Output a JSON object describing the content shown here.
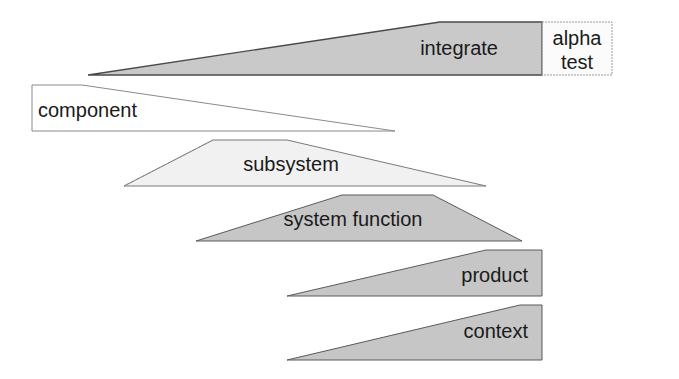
{
  "diagram": {
    "type": "integration-phase-wedges",
    "colors": {
      "background": "#ffffff",
      "mid_gray": "#c8c8c8",
      "light_gray": "#efefef",
      "near_white": "#fbfbfb",
      "stroke": "#555555",
      "text": "#1a1a1a"
    },
    "shapes": [
      {
        "id": "integrate",
        "label": "integrate",
        "points": "88,75 440,22 542,22 542,75",
        "fill": "#c9c9c9",
        "stroke": "#4a4a4a",
        "dashed": false,
        "label_x": 498,
        "label_y": 55,
        "anchor": "end"
      },
      {
        "id": "alpha-test",
        "label_line1": "alpha",
        "label_line2": "test",
        "points": "542,22 612,22 612,75 542,75",
        "fill": "#fbfbfb",
        "stroke": "#9a9a9a",
        "dashed": true,
        "label_x": 577,
        "label_y1": 45,
        "label_y2": 69,
        "anchor": "middle"
      },
      {
        "id": "component",
        "label": "component",
        "points": "32,85 82,85 395,131 32,131",
        "fill": "#ffffff",
        "stroke": "#8a8a8a",
        "dashed": false,
        "label_x": 38,
        "label_y": 117,
        "anchor": "start"
      },
      {
        "id": "subsystem",
        "label": "subsystem",
        "points": "124,186 213,140 287,140 486,186",
        "fill": "#f1f1f1",
        "stroke": "#7a7a7a",
        "dashed": false,
        "label_x": 291,
        "label_y": 171,
        "anchor": "middle"
      },
      {
        "id": "system-function",
        "label": "system function",
        "points": "196,241 342,195 433,195 522,241",
        "fill": "#c6c6c6",
        "stroke": "#5a5a5a",
        "dashed": false,
        "label_x": 353,
        "label_y": 226,
        "anchor": "middle"
      },
      {
        "id": "product",
        "label": "product",
        "points": "287,296 486,250 542,250 542,296",
        "fill": "#c6c6c6",
        "stroke": "#5a5a5a",
        "dashed": false,
        "label_x": 528,
        "label_y": 282,
        "anchor": "end"
      },
      {
        "id": "context",
        "label": "context",
        "points": "287,360 520,305 542,305 542,360",
        "fill": "#c6c6c6",
        "stroke": "#5a5a5a",
        "dashed": false,
        "label_x": 528,
        "label_y": 338,
        "anchor": "end"
      }
    ]
  }
}
